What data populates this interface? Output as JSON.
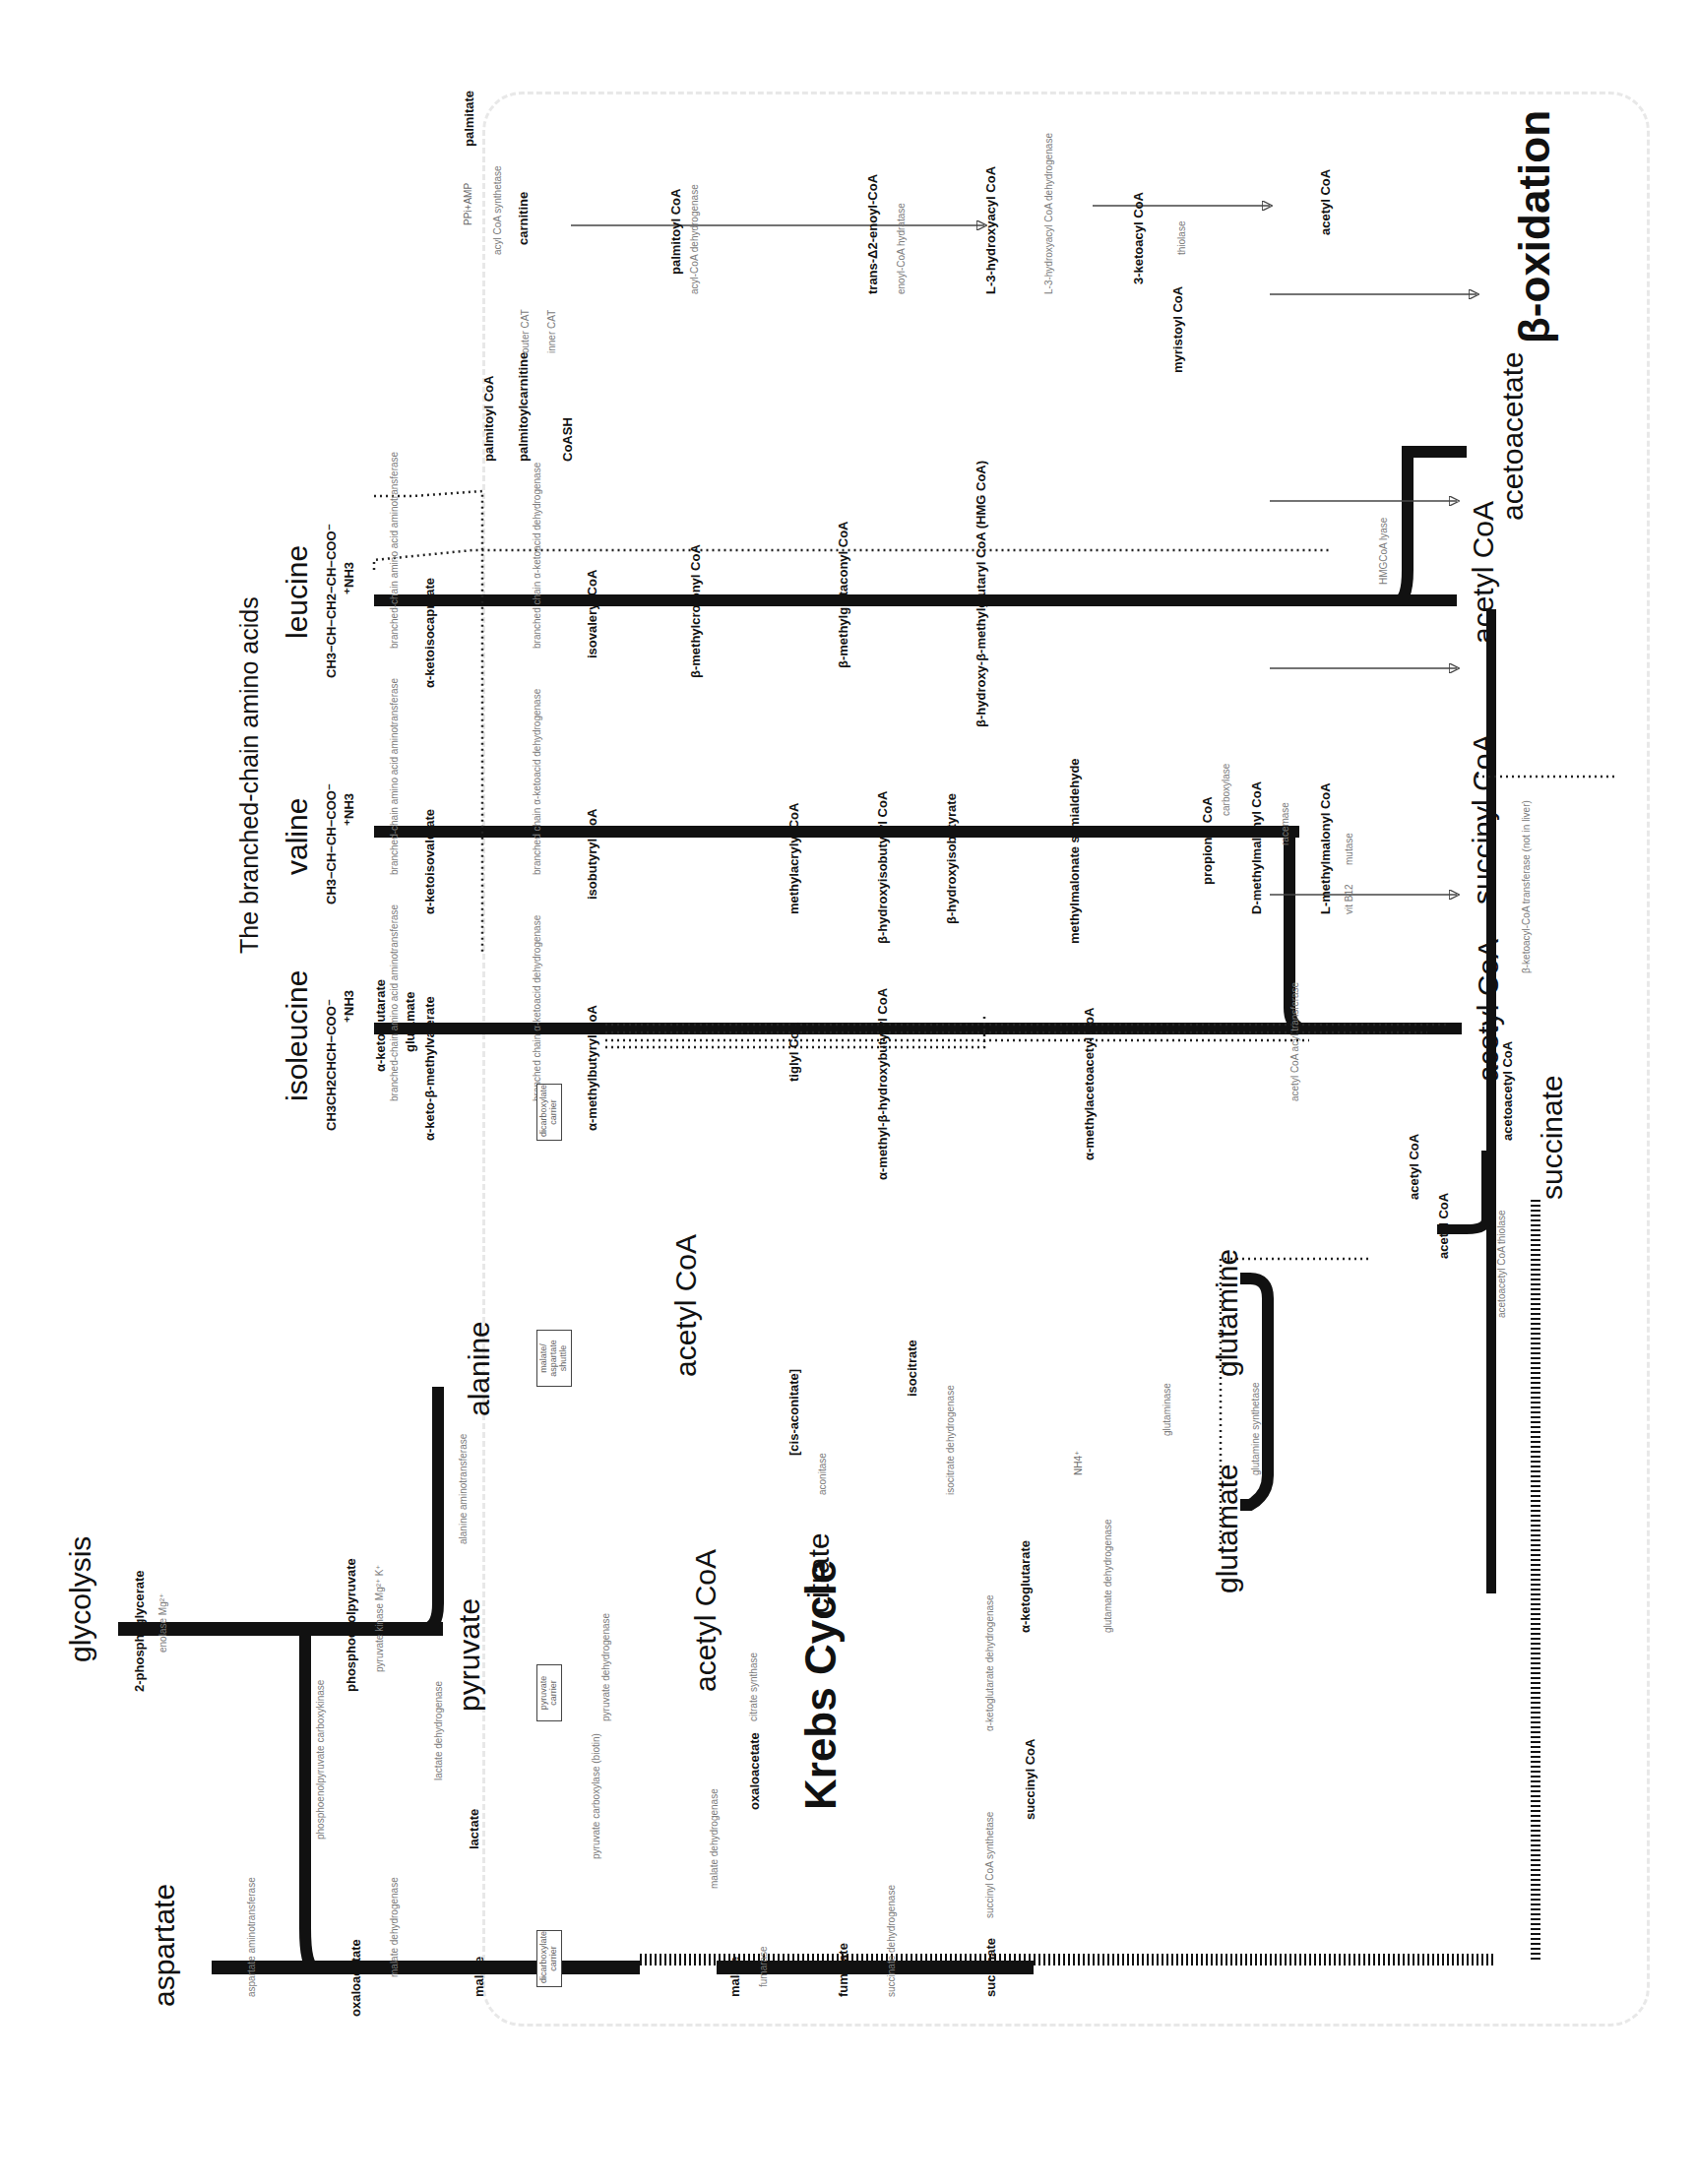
{
  "titles": {
    "bcaa": "The branched-chain amino acids",
    "beta_oxidation": "β-oxidation",
    "krebs": "Krebs Cycle",
    "glycolysis": "glycolysis"
  },
  "amino_acids": {
    "isoleucine": {
      "name": "isoleucine",
      "formula1": "CH3",
      "formula2": "CH3CH2CHCH−COO⁻",
      "formula3": "⁺NH3",
      "steps": [
        {
          "formula": "CH3  O\nCH3CH2−CH−C−COO⁻",
          "name": "α-keto-β-methylvalerate"
        },
        {
          "formula": "CH3  O\nCH3CH2−CH−C−SCoA",
          "name": "α-methylbutyryl CoA"
        },
        {
          "formula": "CH3 O\nCH3CH=C−C−SCoA",
          "name": "tiglyl CoA"
        },
        {
          "formula": "OH CH3 O\nCH3−CH−CH−C−SCoA",
          "name": "α-methyl-β-hydroxybutyryl CoA"
        },
        {
          "formula": "O CH3 O\nCH3−C−CH−C−SCoA",
          "name": "α-methylacetoacetyl CoA"
        }
      ]
    },
    "valine": {
      "name": "valine",
      "formula1": "CH3",
      "formula2": "CH3−CH−CH−COO⁻",
      "formula3": "⁺NH3",
      "steps": [
        {
          "formula": "O\n(CH3)2C−C−COO⁻",
          "name": "α-ketoisovalerate"
        },
        {
          "formula": "O\n(CH3)2C−C−SCoA",
          "name": "isobutyryl CoA"
        },
        {
          "formula": "CH3 O\nCH2=C−C−SCoA",
          "name": "methylacrylyl CoA"
        },
        {
          "formula": "OH CH3 O\nCH2−CH−C−SCoA",
          "name": "β-hydroxyisobutyryl CoA"
        },
        {
          "formula": "",
          "name": "β-hydroxyisobutyrate"
        },
        {
          "formula": "O CH3\nHC−CH−COO⁻",
          "name": "methylmalonate semialdehyde"
        },
        {
          "formula": "O\nCH3CH2C−SCoA",
          "name": "propionyl CoA"
        },
        {
          "formula": "",
          "name": "D-methylmalonyl CoA"
        },
        {
          "formula": "",
          "name": "L-methylmalonyl CoA"
        }
      ]
    },
    "leucine": {
      "name": "leucine",
      "formula1": "CH3",
      "formula2": "CH3−CH−CH2−CH−COO⁻",
      "formula3": "⁺NH3",
      "steps": [
        {
          "formula": "O\n(CH3)2CH−CH2−C−COO⁻",
          "name": "α-ketoisocaproate"
        },
        {
          "formula": "O\n(CH3)2CH−CH2−C−SCoA",
          "name": "isovaleryl CoA"
        },
        {
          "formula": "O\n(CH3)2C=CH−C−SCoA",
          "name": "β-methylcrotonyl CoA"
        },
        {
          "formula": "O\n⁻OOC−CH2−C=CH−C−SCoA",
          "name": "β-methylglutaconyl CoA"
        },
        {
          "formula": "OH O\n⁻OOC−CH2−C−CH2−C−SCoA",
          "name": "β-hydroxy-β-methylglutaryl CoA (HMG CoA)"
        }
      ]
    }
  },
  "bcaa_enzymes": {
    "transaminase": "branched-chain amino acid aminotransferase",
    "bckdh": "branched chain α-ketoacid dehydrogenase",
    "dehydrogenase": "dehydrogenase",
    "hydratase": "hydratase",
    "hydrolase": "hydrolase",
    "carboxylase": "carboxylase",
    "racemase": "racemase",
    "mutase": "mutase",
    "vitb12": "vit B12",
    "acetyl_transferase": "acetyl CoA acyl transferase",
    "hmg_lyase": "HMGCoA lyase",
    "ketoacyl_transferase": "β-ketoacyl-CoA transferase (not in liver)",
    "thiolase": "acetoacetyl CoA thiolase"
  },
  "cofactors": {
    "akg": "α-ketoglutarate",
    "glu": "glutamate",
    "coash": "CoASH",
    "nad": "NAD⁺",
    "nadh": "NADH+H⁺",
    "co2": "CO2",
    "fad": "FAD",
    "fadh2": "FADH2",
    "h2o": "H2O",
    "atp": "ATP",
    "adp": "ADP+Pi"
  },
  "products": {
    "acetyl_coa": "acetyl CoA",
    "succinyl_coa": "succinyl CoA",
    "acetoacetate": "acetoacetate",
    "succinate": "succinate",
    "acetoacetyl_coa": "acetoacetyl CoA"
  },
  "beta_ox": {
    "palmitate": "palmitate",
    "palmitoyl_coa": "palmitoyl CoA",
    "palmitoylcarnitine": "palmitoylcarnitine",
    "carnitine": "carnitine",
    "coash": "CoASH",
    "ppi_amp": "PPi+AMP",
    "atp": "ATP",
    "coash2": "CoASH",
    "acyl_synthetase": "acyl CoA synthetase",
    "outer_cat": "outer CAT",
    "inner_cat": "inner CAT",
    "steps": [
      {
        "formula": "O\nCH3(CH2)12−CH2−CH2−C−SCoA",
        "name": "palmitoyl CoA",
        "enzyme": "acyl-CoA dehydrogenase",
        "cof_in": "FAD",
        "cof_out": "FADH2"
      },
      {
        "formula": "H O\nCH3(CH2)12−C=C−C−SCoA\nH",
        "name": "trans-Δ2-enoyl-CoA",
        "enzyme": "enoyl-CoA hydratase",
        "cof_in": "H2O",
        "cof_out": ""
      },
      {
        "formula": "OH O\nCH3(CH2)12−CH−CH2−C−SCoA",
        "name": "L-3-hydroxyacyl CoA",
        "enzyme": "L-3-hydroxyacyl CoA dehydrogenase",
        "cof_in": "NAD⁺",
        "cof_out": "NADH+H⁺"
      },
      {
        "formula": "O O\nCH3(CH2)12−C−CH2−C−SCoA",
        "name": "3-ketoacyl CoA",
        "enzyme": "thiolase",
        "cof_in": "CoASH",
        "cof_out": ""
      },
      {
        "formula": "O\nH3C−C−SCoA",
        "name": "acetyl CoA"
      }
    ],
    "myristoyl": {
      "formula": "O\nCH3(CH2)12−C−SCoA",
      "name": "myristoyl CoA"
    }
  },
  "glycolysis_area": {
    "pg2": {
      "formula": "COO⁻\nHC−OPO3²⁻\nCH2OH",
      "name": "2-phosphoglycerate"
    },
    "enolase": "enolase Mg²⁺",
    "pep": {
      "formula": "COO⁻\nC−OPO3²⁻\nCH2",
      "name": "phosphoenolpyruvate"
    },
    "pk": "pyruvate kinase Mg²⁺ K⁺",
    "pyruvate": {
      "formula": "COO⁻\nC=O\nCH3",
      "name": "pyruvate"
    },
    "lactate": {
      "formula": "COO⁻\nHCOH\nCH3",
      "name": "lactate"
    },
    "ldh": "lactate dehydrogenase",
    "alanine": {
      "formula": "COO⁻\nH3⁺NCH\nCH3",
      "name": "alanine"
    },
    "alt": "alanine aminotransferase",
    "aspartate": {
      "formula": "COO⁻\nH3⁺NCH\nH2C−COO⁻",
      "name": "aspartate"
    },
    "ast": "aspartate aminotransferase",
    "oaa": {
      "formula": "COO⁻\nC=O\nH2C−COO⁻",
      "name": "oxaloacetate"
    },
    "malate": {
      "formula": "COO⁻\nHCOH\nH2C−COO⁻",
      "name": "malate"
    },
    "mdh": "malate dehydrogenase",
    "pepck": "phosphoenolpyruvate carboxykinase",
    "gtp": "GTP",
    "gdp": "GDP",
    "co2": "CO2",
    "adp": "ADP",
    "atp": "ATP"
  },
  "carriers": {
    "pyruvate": "pyruvate carrier",
    "malate_asp": "malate/ aspartate shuttle",
    "dicarb1": "dicarboxylate carrier",
    "dicarb2": "dicarboxylate carrier"
  },
  "krebs": {
    "acetyl_coa": {
      "formula": "O\nH3C−C−SCoA",
      "name": "acetyl CoA"
    },
    "pdh": "pyruvate dehydrogenase",
    "pdh_cof": "CoASH  thiamin PP  lipoate  riboflavin",
    "pc": "pyruvate carboxylase (biotin)",
    "hco3": "HCO3⁻",
    "citrate": {
      "formula": "CH2COO⁻\nHOC−COO⁻\nH2C−COO⁻",
      "name": "citrate"
    },
    "cs": "citrate synthase",
    "cis_aconitate": "[cis-aconitate]",
    "aconitase": "aconitase",
    "isocitrate": {
      "formula": "CH2COO⁻\nHC−COO⁻\nHOCH−COO⁻",
      "name": "isocitrate"
    },
    "idh": "isocitrate dehydrogenase",
    "mg": "Mg²⁺",
    "akg": {
      "formula": "CH2COO⁻\nCH2\nO=C−COO⁻",
      "name": "α-ketoglutarate"
    },
    "akgdh": "α-ketoglutarate dehydrogenase",
    "succinyl_coa": {
      "formula": "CH2COO⁻\nCH2\nO=C−SCoA",
      "name": "succinyl CoA"
    },
    "scs": "succinyl CoA synthetase",
    "gdp": "GDP+Pi",
    "gtp": "GTP",
    "succinate": {
      "formula": "CH2COO⁻\nCH2COO⁻",
      "name": "succinate"
    },
    "sdh": "succinate dehydrogenase",
    "fumarate": {
      "formula": "HCCOO⁻\n⁻OOCCH",
      "name": "fumarate"
    },
    "fumarase": "fumarase",
    "malate": {
      "formula": "COO⁻\nHCOH\nH2C−COO⁻",
      "name": "malate"
    },
    "mdh": "malate dehydrogenase",
    "oaa": {
      "formula": "COO⁻\nC=O\nH2C−COO⁻",
      "name": "oxaloacetate"
    }
  },
  "glutamine_area": {
    "glutamate": {
      "formula": "CH2COO⁻\nCH2\nH3⁺N−CH−COO⁻",
      "name": "glutamate"
    },
    "glutamine": {
      "formula": "CH2CONH2\nCH2\nH3⁺N−CH−COO⁻",
      "name": "glutamine"
    },
    "gs": "glutamine synthetase",
    "glutaminase": "glutaminase",
    "gdh": "glutamate dehydrogenase",
    "nh4": "NH4⁺",
    "nadp": "NAD(P)⁺",
    "nadph": "NAD(P)H+H⁺"
  },
  "colors": {
    "ink": "#111111",
    "enzyme_gray": "#7a7a7a",
    "frame_gray": "#e8e8e8",
    "highlight_gray": "#bbbbbb"
  }
}
